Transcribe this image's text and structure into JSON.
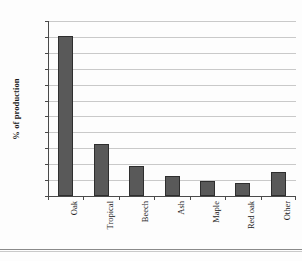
{
  "chart_data": {
    "type": "bar",
    "title": "",
    "subtitle": "",
    "xlabel": "",
    "ylabel": "% of production",
    "categories": [
      "Oak",
      "Tropical",
      "Beech",
      "Ash",
      "Maple",
      "Red oak",
      "Other"
    ],
    "values": [
      50.3,
      16.5,
      9.4,
      6.4,
      4.8,
      4.2,
      7.6
    ],
    "ylim": [
      0,
      55
    ],
    "ytick_labels": [
      "0",
      "5",
      "10",
      "15",
      "20",
      "25",
      "30",
      "35",
      "40",
      "45",
      "50",
      "55"
    ],
    "ytick_values": [
      0,
      5,
      10,
      15,
      20,
      25,
      30,
      35,
      40,
      45,
      50,
      55
    ],
    "grid": true,
    "legend": false,
    "legend_position": "none",
    "series": [
      {
        "name": "% of production",
        "values": [
          50.3,
          16.5,
          9.4,
          6.4,
          4.8,
          4.2,
          7.6
        ]
      }
    ],
    "bar_color": "#595959",
    "bar_edge_color": "#2e2e2e",
    "gridline_color": "#c9c9c9",
    "axis_color": "#4a4a4a",
    "background_color": "#fdfdfd"
  }
}
